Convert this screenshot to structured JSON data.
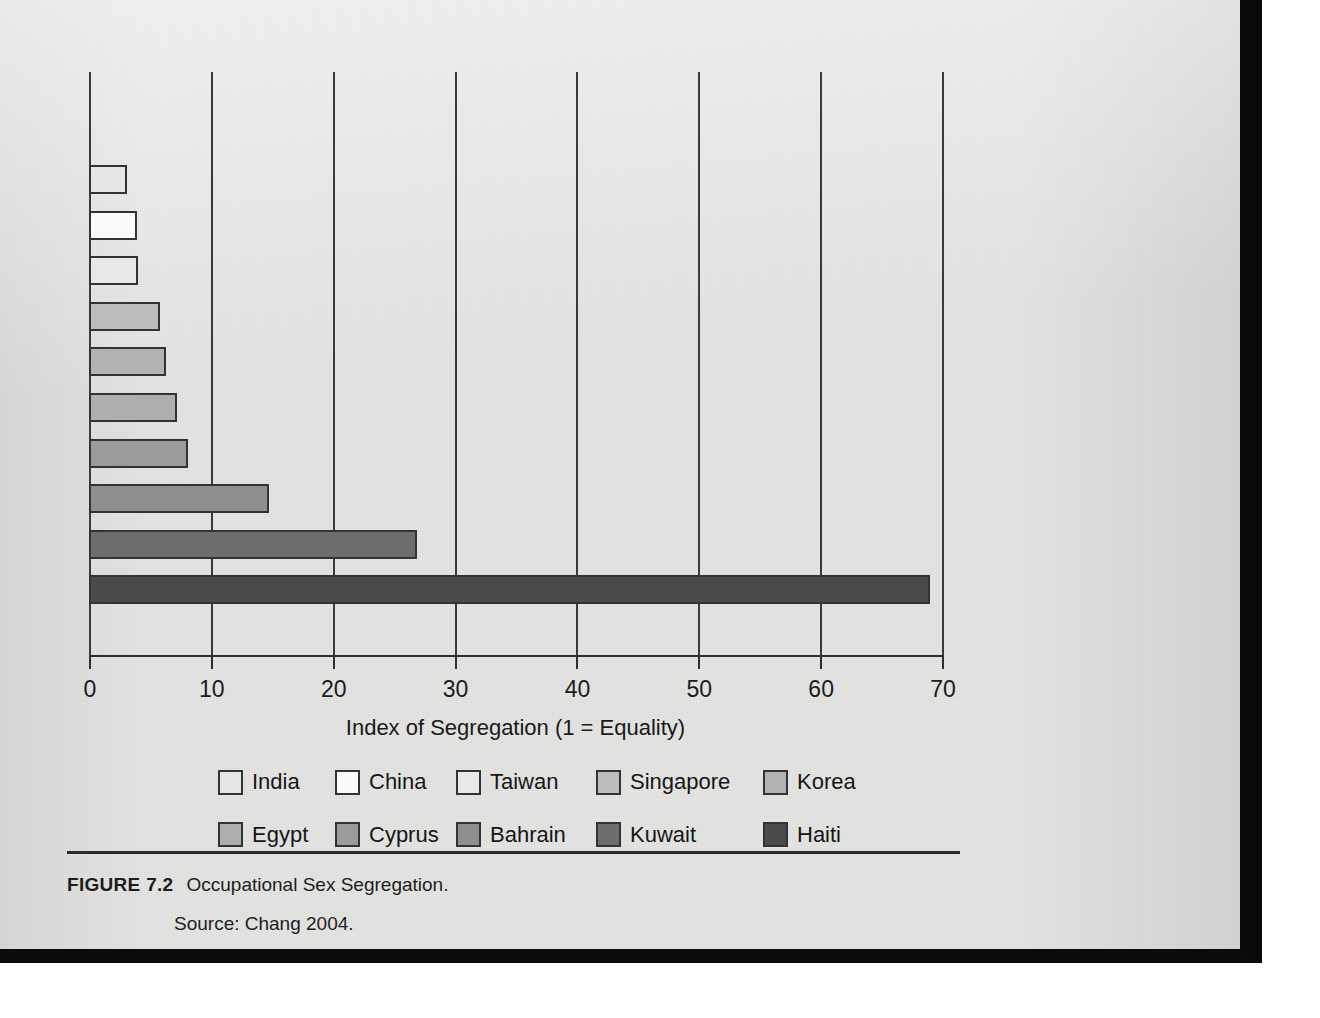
{
  "chart_data": {
    "type": "bar",
    "orientation": "horizontal",
    "title": "Occupational Sex Segregation.",
    "xlabel": "Index of Segregation (1 = Equality)",
    "ylabel": "",
    "xlim": [
      0,
      70
    ],
    "xticks": [
      0,
      10,
      20,
      30,
      40,
      50,
      60,
      70
    ],
    "grid": "vertical",
    "legend_position": "below-axis",
    "categories": [
      "India",
      "China",
      "Taiwan",
      "Singapore",
      "Korea",
      "Egypt",
      "Cyprus",
      "Bahrain",
      "Kuwait",
      "Haiti"
    ],
    "values": [
      3.1,
      3.9,
      4.0,
      5.8,
      6.3,
      7.2,
      8.1,
      14.8,
      26.9,
      69.0
    ],
    "colors": [
      "#e6e6e4",
      "#fbfbfa",
      "#e8e8e6",
      "#bcbcbc",
      "#b2b2b2",
      "#aeaeae",
      "#9b9b9b",
      "#8e8e8e",
      "#6d6d6d",
      "#4a4a4a"
    ],
    "series": [
      {
        "name": "India",
        "value": 3.1,
        "color": "#e6e6e4"
      },
      {
        "name": "China",
        "value": 3.9,
        "color": "#fbfbfa"
      },
      {
        "name": "Taiwan",
        "value": 4.0,
        "color": "#e8e8e6"
      },
      {
        "name": "Singapore",
        "value": 5.8,
        "color": "#bcbcbc"
      },
      {
        "name": "Korea",
        "value": 6.3,
        "color": "#b2b2b2"
      },
      {
        "name": "Egypt",
        "value": 7.2,
        "color": "#aeaeae"
      },
      {
        "name": "Cyprus",
        "value": 8.1,
        "color": "#9b9b9b"
      },
      {
        "name": "Bahrain",
        "value": 14.8,
        "color": "#8e8e8e"
      },
      {
        "name": "Kuwait",
        "value": 26.9,
        "color": "#6d6d6d"
      },
      {
        "name": "Haiti",
        "value": 69.0,
        "color": "#4a4a4a"
      }
    ]
  },
  "axis": {
    "tick_labels": [
      "0",
      "10",
      "20",
      "30",
      "40",
      "50",
      "60",
      "70"
    ],
    "x_axis_title": "Index of Segregation (1 = Equality)"
  },
  "legend": {
    "rows": [
      [
        {
          "label": "India",
          "color": "#e6e6e4"
        },
        {
          "label": "China",
          "color": "#fbfbfa"
        },
        {
          "label": "Taiwan",
          "color": "#e8e8e6"
        },
        {
          "label": "Singapore",
          "color": "#bcbcbc"
        },
        {
          "label": "Korea",
          "color": "#b2b2b2"
        }
      ],
      [
        {
          "label": "Egypt",
          "color": "#aeaeae"
        },
        {
          "label": "Cyprus",
          "color": "#9b9b9b"
        },
        {
          "label": "Bahrain",
          "color": "#8e8e8e"
        },
        {
          "label": "Kuwait",
          "color": "#6d6d6d"
        },
        {
          "label": "Haiti",
          "color": "#4a4a4a"
        }
      ]
    ]
  },
  "caption": {
    "figure_number": "FIGURE 7.2",
    "title": "Occupational Sex Segregation.",
    "source": "Source: Chang 2004."
  },
  "colors": {
    "page_background": "#e4e4e2",
    "axis_line": "#2f2f2f",
    "gridline": "#3a3a3a",
    "bar_outline": "#333333",
    "text": "#1b1b1b",
    "scan_edge": "#090909"
  }
}
